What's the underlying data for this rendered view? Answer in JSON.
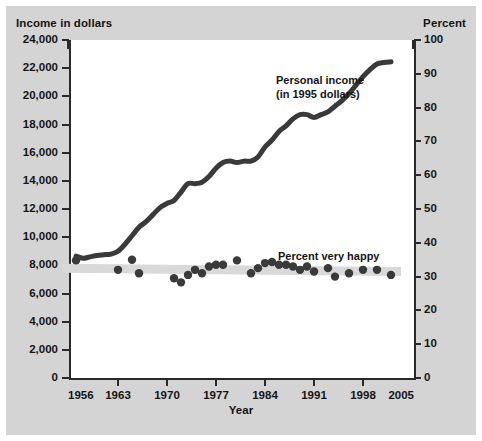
{
  "figure": {
    "left_axis_title": "Income in dollars",
    "right_axis_title": "Percent",
    "x_axis_title": "Year",
    "colors": {
      "background": "#d4d4d4",
      "plot_background": "#ffffff",
      "axis": "#2a2a2a",
      "income_line": "#3a3a3a",
      "happy_dots": "#3a3a3a",
      "happy_band": "#d9d9d9"
    }
  },
  "chart_data": {
    "type": "line",
    "title": "",
    "xlabel": "Year",
    "ylabel": "Income in dollars",
    "y2label": "Percent",
    "xlim": [
      1956,
      2005
    ],
    "ylim": [
      0,
      24000
    ],
    "y2lim": [
      0,
      100
    ],
    "grid": false,
    "legend": "annotations",
    "x_ticks": [
      1956,
      1963,
      1970,
      1977,
      1984,
      1991,
      1998,
      2005
    ],
    "y_ticks_left": [
      0,
      2000,
      4000,
      6000,
      8000,
      10000,
      12000,
      14000,
      16000,
      18000,
      20000,
      22000,
      24000
    ],
    "y_tick_labels_left": [
      "0",
      "2,000",
      "4,000",
      "6,000",
      "8,000",
      "10,000",
      "12,000",
      "14,000",
      "16,000",
      "18,000",
      "20,000",
      "22,000",
      "24,000"
    ],
    "y_ticks_right": [
      0,
      10,
      20,
      30,
      40,
      50,
      60,
      70,
      80,
      90,
      100
    ],
    "y_tick_labels_right": [
      "0",
      "10",
      "20",
      "30",
      "40",
      "50",
      "60",
      "70",
      "80",
      "90",
      "100"
    ],
    "annotations": [
      {
        "text": "Personal income\n(in 1995 dollars)",
        "x": 1986,
        "y": 19500
      },
      {
        "text": "Percent very happy",
        "x": 1987,
        "y": 9400
      }
    ],
    "series": [
      {
        "name": "Personal income (in 1995 dollars)",
        "axis": "left",
        "style": "line",
        "unit": "1995 dollars",
        "x": [
          1957,
          1958,
          1959,
          1960,
          1961,
          1962,
          1963,
          1964,
          1965,
          1966,
          1967,
          1968,
          1969,
          1970,
          1971,
          1972,
          1973,
          1974,
          1975,
          1976,
          1977,
          1978,
          1979,
          1980,
          1981,
          1982,
          1983,
          1984,
          1985,
          1986,
          1987,
          1988,
          1989,
          1990,
          1991,
          1992,
          1993,
          1994,
          1995,
          1996,
          1997,
          1998,
          1999,
          2000,
          2001,
          2002
        ],
        "y": [
          8650,
          8500,
          8600,
          8700,
          8750,
          8800,
          9000,
          9500,
          10100,
          10700,
          11100,
          11600,
          12100,
          12400,
          12600,
          13200,
          13800,
          13800,
          13900,
          14300,
          14900,
          15300,
          15400,
          15300,
          15400,
          15400,
          15700,
          16400,
          16900,
          17500,
          17900,
          18400,
          18700,
          18700,
          18500,
          18700,
          18900,
          19300,
          19700,
          20200,
          20800,
          21400,
          21900,
          22300,
          22400,
          22450
        ]
      },
      {
        "name": "Percent very happy",
        "axis": "right",
        "style": "scatter",
        "unit": "percent",
        "x": [
          1957,
          1963,
          1965,
          1966,
          1971,
          1972,
          1973,
          1974,
          1975,
          1976,
          1977,
          1978,
          1980,
          1982,
          1983,
          1984,
          1985,
          1986,
          1987,
          1988,
          1989,
          1990,
          1991,
          1993,
          1994,
          1996,
          1998,
          2000,
          2002
        ],
        "y": [
          34.8,
          32.0,
          35.0,
          31.0,
          29.5,
          28.3,
          30.5,
          32.0,
          31.0,
          33.0,
          33.5,
          33.5,
          34.8,
          31.0,
          32.5,
          34.0,
          34.3,
          33.5,
          33.5,
          33.0,
          32.0,
          33.0,
          31.5,
          32.5,
          30.0,
          31.0,
          32.0,
          32.0,
          30.5
        ]
      }
    ],
    "trend_band": {
      "series": "Percent very happy",
      "description": "flat shaded band",
      "y_start": 32.5,
      "y_end": 31.5
    }
  }
}
